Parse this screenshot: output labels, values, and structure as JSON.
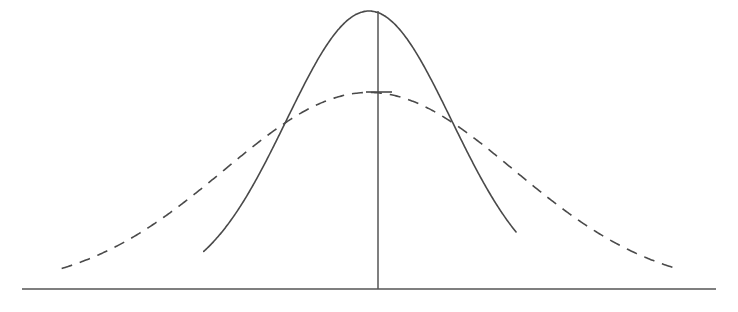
{
  "figure": {
    "title": "",
    "background_color": "#ffffff",
    "width": 738,
    "height": 312,
    "stroke_color": "#4a4a4a",
    "axis_color": "#555555",
    "stroke_width": 1.6,
    "axis_stroke_width": 1.5,
    "dash_pattern": "11 8",
    "mean_label": "",
    "peak_marker_label": ""
  },
  "axes": {
    "baseline": {
      "name": "horizontal-axis",
      "x1": 22,
      "y1": 289,
      "x2": 716,
      "y2": 289
    },
    "center_line": {
      "name": "vertical-mean-line",
      "x": 378,
      "y_top": 11,
      "y_bottom": 289
    },
    "peak_tick": {
      "name": "dashed-peak-tick",
      "x1": 366,
      "y1": 92,
      "x2": 392,
      "y2": 92
    },
    "x_range": [
      22,
      716
    ],
    "y_baseline": 289,
    "grid": false,
    "tick_labels": [],
    "axis_labels": {
      "x": "",
      "y": ""
    }
  },
  "chart_data": {
    "type": "line",
    "title": "",
    "subtitle": "",
    "xlabel": "",
    "ylabel": "",
    "xlim": [
      -4.2,
      4.2
    ],
    "ylim": [
      0,
      1.05
    ],
    "grid": false,
    "legend_position": "none",
    "legend_entries": [],
    "annotations": [
      {
        "label": "mean (vertical line at center)",
        "x": 0.0
      },
      {
        "label": "tick at dashed-curve peak",
        "x": 0.0,
        "y": 0.707
      },
      {
        "label": "curves cross (left)",
        "x": -1.52,
        "y": 0.363
      },
      {
        "label": "curves cross (right)",
        "x": 1.37,
        "y": 0.392
      }
    ],
    "series": [
      {
        "name": "narrow-distribution",
        "style": "solid",
        "color": "#4a4a4a",
        "peak": {
          "x": 0.0,
          "y": 1.0
        },
        "sigma": 1.0,
        "x_start": -2.0,
        "x_end": 1.78,
        "x": [
          -2.0,
          -1.85,
          -1.7,
          -1.55,
          -1.4,
          -1.25,
          -1.1,
          -0.95,
          -0.8,
          -0.65,
          -0.5,
          -0.35,
          -0.2,
          -0.05,
          0.0,
          0.05,
          0.2,
          0.35,
          0.5,
          0.65,
          0.8,
          0.95,
          1.1,
          1.25,
          1.4,
          1.55,
          1.7,
          1.78
        ],
        "y": [
          0.047,
          0.067,
          0.093,
          0.127,
          0.169,
          0.22,
          0.28,
          0.347,
          0.419,
          0.493,
          0.566,
          0.635,
          0.696,
          0.747,
          0.751,
          0.747,
          0.696,
          0.635,
          0.566,
          0.493,
          0.419,
          0.347,
          0.28,
          0.22,
          0.169,
          0.127,
          0.093,
          0.08
        ]
      },
      {
        "name": "wide-distribution",
        "style": "dashed",
        "color": "#4a4a4a",
        "peak": {
          "x": 0.0,
          "y": 0.707
        },
        "sigma": 1.75,
        "x_start": -3.72,
        "x_end": 3.69,
        "x": [
          -3.72,
          -3.4,
          -3.0,
          -2.6,
          -2.2,
          -1.8,
          -1.4,
          -1.0,
          -0.6,
          -0.2,
          0.0,
          0.2,
          0.6,
          1.0,
          1.4,
          1.8,
          2.2,
          2.6,
          3.0,
          3.4,
          3.69
        ],
        "y": [
          0.044,
          0.056,
          0.078,
          0.106,
          0.143,
          0.19,
          0.246,
          0.309,
          0.375,
          0.436,
          0.449,
          0.436,
          0.375,
          0.309,
          0.246,
          0.19,
          0.143,
          0.106,
          0.078,
          0.056,
          0.045
        ]
      }
    ]
  }
}
